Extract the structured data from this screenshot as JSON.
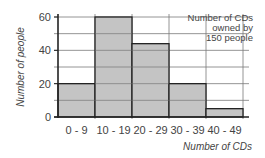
{
  "chart_data": {
    "type": "bar",
    "subtype": "histogram",
    "title": "",
    "annotation": [
      "Number of CDs",
      "owned by",
      "150 people"
    ],
    "categories": [
      "0 - 9",
      "10 - 19",
      "20 - 29",
      "30 - 39",
      "40 - 49"
    ],
    "values": [
      20,
      60,
      44,
      20,
      5
    ],
    "values_note": "Read from bar heights against gridlines (no data labels in image). 20-29 measures about 44 and 40-49 about 5, giving a total of 149 against the annotation's stated 150. Exact values for those two bars are not legible from the image.",
    "xlabel": "Number of CDs",
    "ylabel": "Number of people",
    "ylim": [
      0,
      60
    ],
    "yticks": [
      0,
      20,
      40,
      60
    ],
    "minor_gridlines": [
      10,
      30,
      50
    ],
    "grid": true,
    "legend": null,
    "bar_color": "#c4c4c4",
    "bar_edge_color": "#222222",
    "grid_color": "#7a7a7a"
  }
}
